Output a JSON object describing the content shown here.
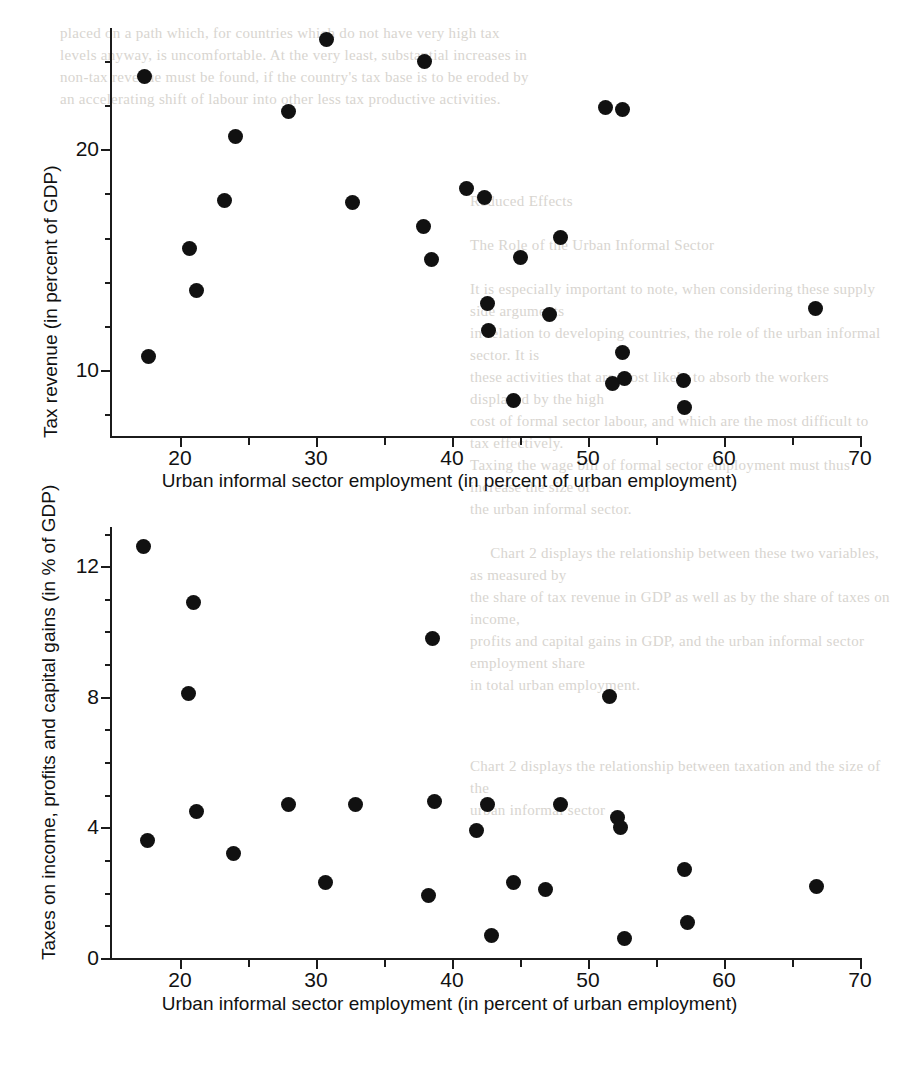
{
  "page": {
    "background_color": "#ffffff",
    "ink_color": "#111111",
    "bleed_through_text_top": "placed on a path which, for countries which do not have very high tax\nlevels anyway, is uncomfortable. At the very least, substantial increases in\nnon-tax revenue must be found, if the country's tax base is to be eroded by\nan accelerating shift of labour into other less tax productive activities.",
    "bleed_through_text_mid": "Reduced Effects\n\nThe Role of the Urban Informal Sector\n\nIt is especially important to note, when considering these supply side arguments\nin relation to developing countries, the role of the urban informal sector. It is\nthese activities that are most likely to absorb the workers displaced by the high\ncost of formal sector labour, and which are the most difficult to tax effectively.\nTaxing the wage bill of formal sector employment must thus increase the size of\nthe urban informal sector.\n\n     Chart 2 displays the relationship between these two variables, as measured by\nthe share of tax revenue in GDP as well as by the share of taxes on income,\nprofits and capital gains in GDP, and the urban informal sector employment share\nin total urban employment.",
    "bleed_through_text_bot": "Chart 2 displays the relationship between taxation and the size of the\nurban informal sector"
  },
  "charts": [
    {
      "id": "chart-top",
      "chart_data": {
        "type": "scatter",
        "title": "",
        "xlabel": "Urban informal sector employment (in percent of urban employment)",
        "ylabel": "Tax revenue (in percent of GDP)",
        "xlim": [
          15,
          70
        ],
        "ylim": [
          7,
          25.5
        ],
        "grid": false,
        "legend": "none",
        "x_ticks_major": [
          20,
          30,
          40,
          50,
          60,
          70
        ],
        "x_ticks_minor": [
          25,
          35,
          45,
          55,
          65
        ],
        "y_ticks_major": [
          10,
          20
        ],
        "y_ticks_minor": [
          8,
          12,
          14,
          16,
          18,
          22,
          24
        ],
        "points": [
          {
            "x": 17.4,
            "y": 23.3
          },
          {
            "x": 17.7,
            "y": 10.6
          },
          {
            "x": 20.7,
            "y": 15.5
          },
          {
            "x": 21.2,
            "y": 13.6
          },
          {
            "x": 23.3,
            "y": 17.7
          },
          {
            "x": 24.1,
            "y": 20.6
          },
          {
            "x": 28.0,
            "y": 21.7
          },
          {
            "x": 30.8,
            "y": 25.0
          },
          {
            "x": 32.7,
            "y": 17.6
          },
          {
            "x": 37.9,
            "y": 16.5
          },
          {
            "x": 38.0,
            "y": 24.0
          },
          {
            "x": 38.5,
            "y": 15.0
          },
          {
            "x": 41.1,
            "y": 18.2
          },
          {
            "x": 42.4,
            "y": 17.8
          },
          {
            "x": 42.6,
            "y": 13.0
          },
          {
            "x": 42.7,
            "y": 11.8
          },
          {
            "x": 44.5,
            "y": 8.6
          },
          {
            "x": 45.0,
            "y": 15.1
          },
          {
            "x": 47.2,
            "y": 12.5
          },
          {
            "x": 48.0,
            "y": 16.0
          },
          {
            "x": 51.3,
            "y": 21.9
          },
          {
            "x": 51.8,
            "y": 9.4
          },
          {
            "x": 52.5,
            "y": 21.8
          },
          {
            "x": 52.5,
            "y": 10.8
          },
          {
            "x": 52.7,
            "y": 9.6
          },
          {
            "x": 57.0,
            "y": 9.5
          },
          {
            "x": 57.1,
            "y": 8.3
          },
          {
            "x": 66.7,
            "y": 12.8
          }
        ]
      }
    },
    {
      "id": "chart-bot",
      "chart_data": {
        "type": "scatter",
        "title": "",
        "xlabel": "Urban informal sector employment (in percent of urban employment)",
        "ylabel": "Taxes on income, profits and capital gains (in % of GDP)",
        "xlim": [
          15,
          70
        ],
        "ylim": [
          0,
          13.2
        ],
        "grid": false,
        "legend": "none",
        "x_ticks_major": [
          20,
          30,
          40,
          50,
          60,
          70
        ],
        "x_ticks_minor": [
          25,
          35,
          45,
          55,
          65
        ],
        "y_ticks_major": [
          0,
          4,
          8,
          12
        ],
        "y_ticks_minor": [
          1,
          2,
          3,
          5,
          6,
          7,
          9,
          10,
          11,
          13
        ],
        "points": [
          {
            "x": 17.3,
            "y": 12.6
          },
          {
            "x": 17.6,
            "y": 3.6
          },
          {
            "x": 20.6,
            "y": 8.1
          },
          {
            "x": 21.2,
            "y": 4.5
          },
          {
            "x": 21.0,
            "y": 10.9
          },
          {
            "x": 23.9,
            "y": 3.2
          },
          {
            "x": 28.0,
            "y": 4.7
          },
          {
            "x": 30.7,
            "y": 2.3
          },
          {
            "x": 32.9,
            "y": 4.7
          },
          {
            "x": 38.3,
            "y": 1.9
          },
          {
            "x": 38.6,
            "y": 9.8
          },
          {
            "x": 38.7,
            "y": 4.8
          },
          {
            "x": 41.8,
            "y": 3.9
          },
          {
            "x": 42.6,
            "y": 4.7
          },
          {
            "x": 42.9,
            "y": 0.7
          },
          {
            "x": 44.5,
            "y": 2.3
          },
          {
            "x": 46.9,
            "y": 2.1
          },
          {
            "x": 48.0,
            "y": 4.7
          },
          {
            "x": 51.6,
            "y": 8.0
          },
          {
            "x": 52.2,
            "y": 4.3
          },
          {
            "x": 52.4,
            "y": 4.0
          },
          {
            "x": 52.7,
            "y": 0.6
          },
          {
            "x": 57.1,
            "y": 2.7
          },
          {
            "x": 57.3,
            "y": 1.1
          },
          {
            "x": 66.8,
            "y": 2.2
          }
        ]
      }
    }
  ]
}
